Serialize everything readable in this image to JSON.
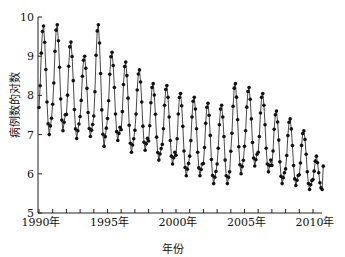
{
  "chart_data": {
    "type": "line",
    "title": "",
    "xlabel": "年份",
    "ylabel": "病例数的对数",
    "ylim": [
      5,
      10
    ],
    "xlim": [
      1990,
      2010.8
    ],
    "yticks": [
      "5",
      "6",
      "7",
      "8",
      "9",
      "10"
    ],
    "xticks": [
      "1990年",
      "1995年",
      "2000年",
      "2005年",
      "2010年"
    ],
    "grid": false,
    "legend": null,
    "markers": true,
    "frequency": "monthly",
    "series": [
      {
        "name": "病例数的对数",
        "years": [
          1990,
          1991,
          1992,
          1993,
          1994,
          1995,
          1996,
          1997,
          1998,
          1999,
          2000,
          2001,
          2002,
          2003,
          2004,
          2005,
          2006,
          2007,
          2008,
          2009,
          2010
        ],
        "annual_peaks": [
          9.77,
          9.8,
          9.36,
          9.0,
          9.8,
          9.1,
          8.85,
          8.65,
          8.3,
          8.25,
          8.05,
          7.95,
          7.8,
          7.75,
          8.3,
          8.2,
          8.05,
          7.6,
          7.4,
          7.1,
          6.45
        ],
        "annual_troughs": [
          7.0,
          7.1,
          6.9,
          6.95,
          6.7,
          6.85,
          6.55,
          6.6,
          6.35,
          6.25,
          5.95,
          5.95,
          5.75,
          5.75,
          6.0,
          6.2,
          6.05,
          5.75,
          5.7,
          5.6,
          5.6
        ]
      }
    ]
  },
  "labels": {
    "xlabel": "年份",
    "ylabel": "病例数的对数"
  }
}
